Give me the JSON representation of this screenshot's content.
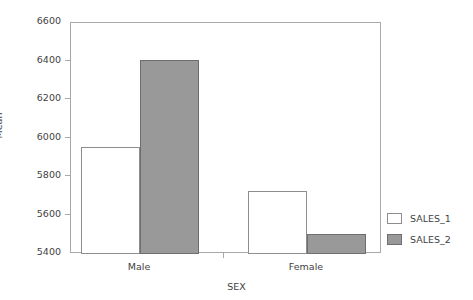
{
  "chart_data": {
    "type": "bar",
    "title": "",
    "xlabel": "SEX",
    "ylabel": "Mean",
    "categories": [
      "Male",
      "Female"
    ],
    "series": [
      {
        "name": "SALES_1",
        "values": [
          5955,
          5725
        ],
        "color": "#ffffff"
      },
      {
        "name": "SALES_2",
        "values": [
          6408,
          5503
        ],
        "color": "#999999"
      }
    ],
    "ylim": [
      5400,
      6600
    ],
    "yticks": [
      5400,
      5600,
      5800,
      6000,
      6200,
      6400,
      6600
    ],
    "ytick_labels": [
      "5400",
      "5600",
      "5800",
      "6000",
      "6200",
      "6400",
      "6600"
    ],
    "grid": false,
    "legend_position": "right-bottom",
    "frame": true
  },
  "legend": {
    "entries": [
      {
        "label": "SALES_1"
      },
      {
        "label": "SALES_2"
      }
    ]
  },
  "axes": {
    "x_title": "SEX",
    "y_title": "Mean",
    "x_tick_labels": [
      "Male",
      "Female"
    ],
    "y_tick_labels": [
      "5400",
      "5600",
      "5800",
      "6000",
      "6200",
      "6400",
      "6600"
    ]
  },
  "colors": {
    "series_1_fill": "#ffffff",
    "series_2_fill": "#999999",
    "axis_line": "#a8a8a8",
    "text": "#3f3f3f",
    "background": "#ffffff"
  }
}
